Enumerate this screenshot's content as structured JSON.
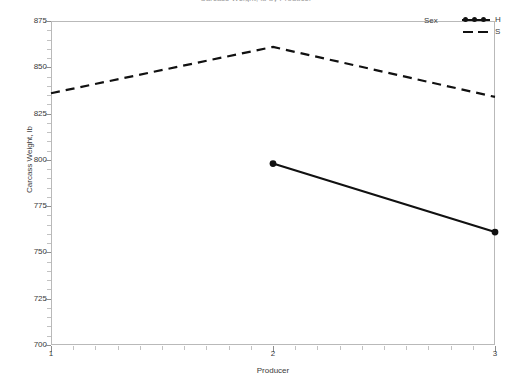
{
  "figure": {
    "clipped_title": "Carcass Weight, lb by Producer",
    "width": 512,
    "height": 386
  },
  "legend": {
    "title": "Sex",
    "entries": [
      {
        "label": "H",
        "style": "solid-with-markers"
      },
      {
        "label": "S",
        "style": "dashed"
      }
    ]
  },
  "axes": {
    "y": {
      "title": "Carcass Weight, lb",
      "ticks": [
        "700",
        "725",
        "750",
        "775",
        "800",
        "825",
        "850",
        "875"
      ]
    },
    "x": {
      "title": "Producer",
      "ticks": [
        "1",
        "2",
        "3"
      ]
    }
  },
  "chart_data": {
    "type": "line",
    "title": "Carcass Weight, lb by Producer",
    "xlabel": "Producer",
    "ylabel": "Carcass Weight, lb",
    "x": [
      1,
      2,
      3
    ],
    "xlim": [
      1,
      3
    ],
    "ylim": [
      700,
      875
    ],
    "ytick_step": 25,
    "grid": false,
    "legend_title": "Sex",
    "legend_position": "top-right",
    "series": [
      {
        "name": "H",
        "line_style": "solid",
        "markers": true,
        "marker_shape": "circle",
        "color": "#111111",
        "x": [
          2,
          3
        ],
        "values": [
          798,
          761
        ]
      },
      {
        "name": "S",
        "line_style": "dashed",
        "markers": false,
        "color": "#111111",
        "x": [
          1,
          2,
          3
        ],
        "values": [
          836,
          861,
          834
        ]
      }
    ]
  }
}
